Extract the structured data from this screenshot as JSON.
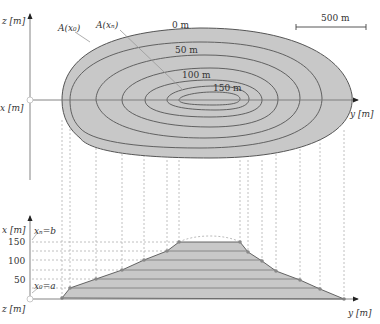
{
  "top_view": {
    "z_axis_label": "z [m]",
    "x_axis_label": "x [m]",
    "y_axis_label": "y [m]",
    "scale_bar_label": "500 m",
    "area_label_0": "A(x₀)",
    "area_label_n": "A(xₙ)",
    "contours": [
      {
        "label": "0 m"
      },
      {
        "label": "50 m"
      },
      {
        "label": "100 m"
      },
      {
        "label": "150 m"
      }
    ]
  },
  "side_view": {
    "x_axis_label": "x [m]",
    "z_axis_label": "z [m]",
    "y_axis_label": "y [m]",
    "ticks": [
      "150",
      "100",
      "50"
    ],
    "upper_bound_label": "xₙ=b",
    "lower_bound_label": "x₀=a"
  },
  "colors": {
    "fill": "#c8c8c8",
    "line": "#555555",
    "dash": "#aaaaaa",
    "point": "#777777"
  }
}
